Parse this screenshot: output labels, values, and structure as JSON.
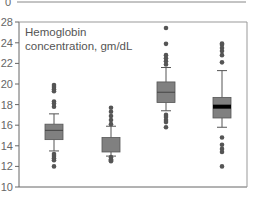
{
  "top_panel": {
    "tick_label": "0"
  },
  "chart_data": {
    "type": "boxplot",
    "title": "Hemoglobin concentration, gm/dL",
    "title_lines": [
      "Hemoglobin",
      "concentration, gm/dL"
    ],
    "xlabel": "",
    "ylabel": "",
    "ylim": [
      10,
      28
    ],
    "yticks": [
      10,
      12,
      14,
      16,
      18,
      20,
      22,
      24,
      28
    ],
    "ytick_labels": [
      "10",
      "12",
      "14",
      "16",
      "18",
      "20",
      "22",
      "24",
      "28"
    ],
    "grid": false,
    "legend": null,
    "colors": {
      "box": "#808080",
      "median": "#444444",
      "median_thick": "#000000",
      "axis": "#666666",
      "point": "#555555"
    },
    "groups": [
      {
        "q1": 14.6,
        "median": 15.5,
        "q3": 16.1,
        "whisker_low": 13.5,
        "whisker_high": 17.1,
        "outliers": [
          19.9,
          19.7,
          19.5,
          19.3,
          18.3,
          18.1,
          17.8,
          13.2,
          13.0,
          12.8,
          12.6,
          12.0
        ],
        "median_style": "thin"
      },
      {
        "q1": 13.4,
        "median": 14.2,
        "q3": 14.8,
        "whisker_low": 13.0,
        "whisker_high": 15.9,
        "outliers": [
          17.7,
          17.3,
          16.9,
          16.5,
          16.1,
          12.9,
          12.7,
          12.6,
          12.5
        ],
        "median_style": "none"
      },
      {
        "q1": 18.2,
        "median": 19.2,
        "q3": 20.2,
        "whisker_low": 17.4,
        "whisker_high": 21.6,
        "outliers": [
          26.9,
          23.9,
          22.8,
          22.5,
          22.2,
          21.9,
          17.0,
          16.8,
          16.5,
          16.3,
          15.8
        ],
        "median_style": "thin"
      },
      {
        "q1": 16.7,
        "median": 17.8,
        "q3": 18.7,
        "whisker_low": 15.8,
        "whisker_high": 21.3,
        "outliers": [
          24.1,
          23.8,
          23.5,
          23.2,
          22.8,
          22.1,
          14.8,
          14.1,
          13.7,
          13.4,
          12.0
        ],
        "median_style": "thick"
      }
    ]
  }
}
